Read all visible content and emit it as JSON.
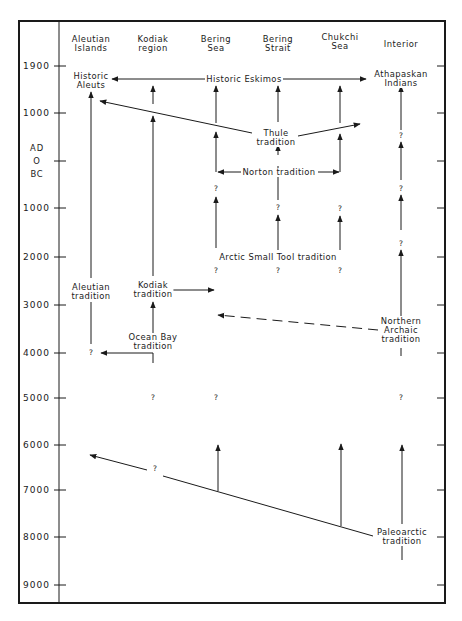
{
  "columns": [
    {
      "label": "Aleutian\nIslands",
      "x": 91
    },
    {
      "label": "Kodiak\nregion",
      "x": 153
    },
    {
      "label": "Bering\nSea",
      "x": 216
    },
    {
      "label": "Bering\nStrait",
      "x": 278
    },
    {
      "label": "Chukchi\nSea",
      "x": 340
    },
    {
      "label": "Interior",
      "x": 401
    }
  ],
  "axis": {
    "ticks": [
      {
        "label": "1900",
        "y": 66
      },
      {
        "label": "1000",
        "y": 113
      },
      {
        "label": "0",
        "y": 161
      },
      {
        "label": "1000",
        "y": 208
      },
      {
        "label": "2000",
        "y": 257
      },
      {
        "label": "3000",
        "y": 305
      },
      {
        "label": "4000",
        "y": 353
      },
      {
        "label": "5000",
        "y": 398
      },
      {
        "label": "6000",
        "y": 445
      },
      {
        "label": "7000",
        "y": 490
      },
      {
        "label": "8000",
        "y": 537
      },
      {
        "label": "9000",
        "y": 585
      }
    ],
    "era_ad": "AD",
    "era_zero": "O",
    "era_bc": "BC"
  },
  "traditions": {
    "historic_aleuts": "Historic\nAleuts",
    "historic_eskimos": "Historic Eskimos",
    "athapaskan_indians": "Athapaskan\nIndians",
    "thule": "Thule\ntradition",
    "norton": "Norton tradition",
    "arctic_small_tool": "Arctic Small Tool tradition",
    "aleutian": "Aleutian\ntradition",
    "kodiak": "Kodiak\ntradition",
    "ocean_bay": "Ocean Bay\ntradition",
    "northern_archaic": "Northern\nArchaic\ntradition",
    "paleoarctic": "Paleoarctic\ntradition"
  },
  "uncertain_marker": "?",
  "colors": {
    "ink": "#1a1a1a",
    "background": "#ffffff"
  }
}
